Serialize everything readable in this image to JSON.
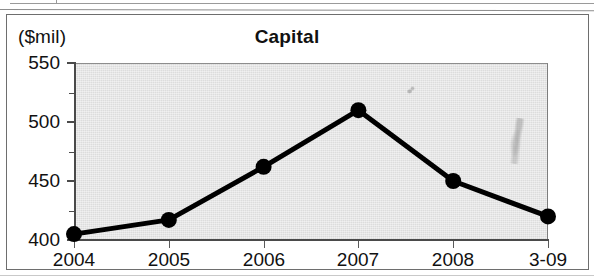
{
  "figure": {
    "unit_label": "($mil)",
    "title": "Capital"
  },
  "chart_data": {
    "type": "line",
    "title": "Capital",
    "subtitle": "",
    "xlabel": "",
    "ylabel": "($mil)",
    "categories": [
      "2004",
      "2005",
      "2006",
      "2007",
      "2008",
      "3-09"
    ],
    "values": [
      405,
      417,
      462,
      510,
      450,
      420
    ],
    "series": [
      {
        "name": "Capital",
        "values": [
          405,
          417,
          462,
          510,
          450,
          420
        ]
      }
    ],
    "ylim": [
      400,
      550
    ],
    "ytick_labels": [
      "550",
      "500",
      "450",
      "400"
    ],
    "ytick_values": [
      550,
      500,
      450,
      400
    ],
    "yminor_tick_values": [
      525,
      475,
      425
    ],
    "xtick_labels": [
      "2004",
      "2005",
      "2006",
      "2007",
      "2008",
      "3-09"
    ],
    "grid": false,
    "legend": "none",
    "marker": "filled-circle",
    "line_color": "#000000",
    "marker_color": "#000000",
    "plot_background": "#dcdcdc"
  },
  "colors": {
    "ink": "#111111",
    "axis": "#4a4a4a",
    "plot_fill": "#dcdcdc",
    "frame": "#6e6e6e"
  }
}
